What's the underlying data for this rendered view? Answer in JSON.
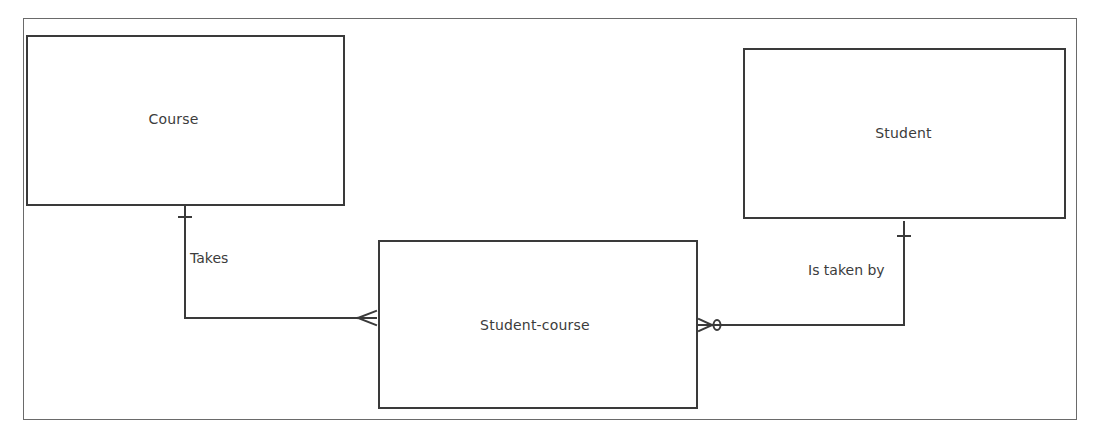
{
  "diagram": {
    "type": "entity-relationship",
    "notation": "crow's foot",
    "colors": {
      "line": "#3a3a3a",
      "text": "#3c3c3c",
      "frame": "#6a6a6a",
      "background": "#ffffff"
    },
    "entities": [
      {
        "id": "course",
        "label": "Course"
      },
      {
        "id": "student",
        "label": "Student"
      },
      {
        "id": "student_course",
        "label": "Student-course"
      }
    ],
    "relationships": [
      {
        "label": "Takes",
        "from": "course",
        "to": "student_course",
        "from_cardinality": "one",
        "to_cardinality": "many"
      },
      {
        "label": "Is taken by",
        "from": "student",
        "to": "student_course",
        "from_cardinality": "one",
        "to_cardinality": "zero-or-many"
      }
    ]
  }
}
